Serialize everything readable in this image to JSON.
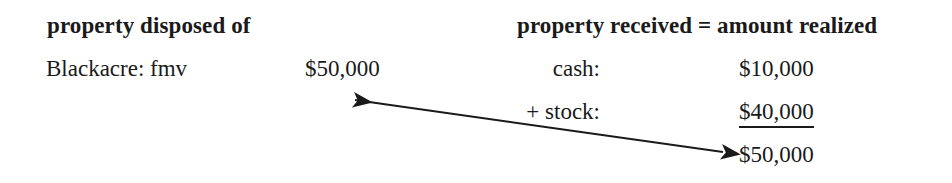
{
  "figure": {
    "background_color": "#ffffff",
    "text_color": "#1a1a1a",
    "width": 952,
    "height": 183
  },
  "left_column": {
    "header": "property disposed of",
    "rows": [
      {
        "label": "Blackacre: fmv",
        "amount": "$50,000"
      }
    ]
  },
  "right_column": {
    "header": "property received = amount realized",
    "rows": [
      {
        "label": "cash:",
        "amount": "$10,000",
        "underlined": false
      },
      {
        "label": "+ stock:",
        "amount": "$40,000",
        "underlined": true
      },
      {
        "label": "",
        "amount": "$50,000",
        "underlined": false
      }
    ]
  },
  "arrow": {
    "name": "double-headed-arrow",
    "from_x": 723,
    "from_y": 152,
    "to_x": 355,
    "to_y": 100,
    "color": "#1a1a1a",
    "stroke_width": 2,
    "double_headed": true
  }
}
